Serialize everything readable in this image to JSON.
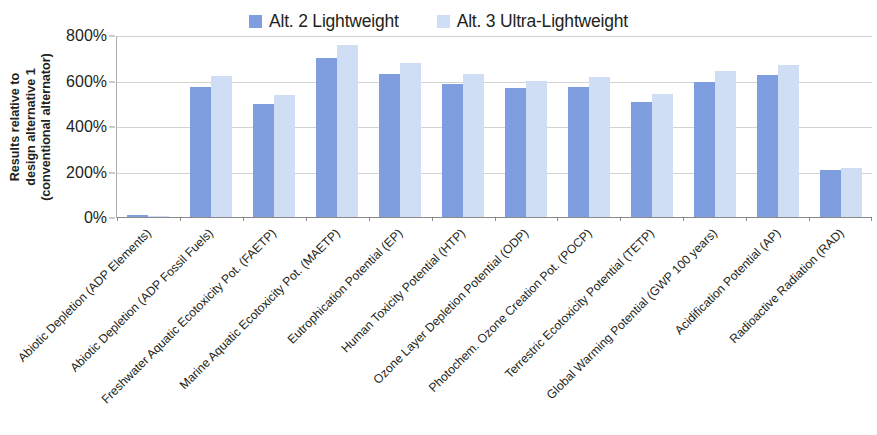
{
  "chart_data": {
    "type": "bar",
    "title": "",
    "xlabel": "",
    "ylabel": "Results relative to design alternative 1 (conventional alternator)",
    "ylabel_lines": [
      "Results relative to",
      "design alternative 1",
      "(conventional alternator)"
    ],
    "ylim": [
      0,
      800
    ],
    "ytick_labels": [
      "800%",
      "600%",
      "400%",
      "200%",
      "0%"
    ],
    "ytick_values": [
      800,
      600,
      400,
      200,
      0
    ],
    "ytick_step": 200,
    "grid": true,
    "legend_position": "top-center",
    "categories": [
      "Abiotic Depletion (ADP Elements)",
      "Abiotic Depletion (ADP Fossil Fuels)",
      "Freshwater Aquatic Ecotoxicity Pot. (FAETP)",
      "Marine Aquatic Ecotoxicity Pot. (MAETP)",
      "Eutrophication Potential (EP)",
      "Human Toxicity Potential (HTP)",
      "Ozone Layer Depletion Potential (ODP)",
      "Photochem. Ozone Creation Pot. (POCP)",
      "Terrestric Ecotoxicity Potential (TETP)",
      "Global Warming Potential (GWP 100 years)",
      "Acidification Potential (AP)",
      "Radioactive Radiation (RAD)"
    ],
    "series": [
      {
        "name": "Alt. 2 Lightweight",
        "color": "#7e9ee0",
        "values": [
          10,
          570,
          495,
          700,
          630,
          585,
          565,
          570,
          505,
          595,
          625,
          205
        ]
      },
      {
        "name": "Alt. 3 Ultra-Lightweight",
        "color": "#cfdef4",
        "values": [
          4,
          620,
          535,
          755,
          675,
          630,
          600,
          615,
          540,
          640,
          670,
          215
        ]
      }
    ]
  }
}
